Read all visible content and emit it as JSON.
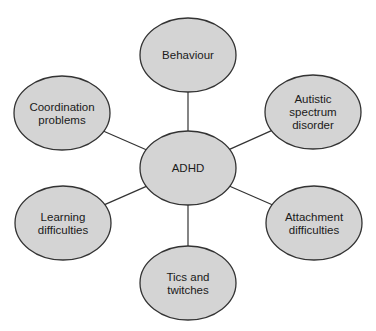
{
  "diagram": {
    "type": "mind-map",
    "center": {
      "id": "adhd",
      "label": [
        "ADHD"
      ],
      "cx": 188,
      "cy": 168
    },
    "nodes": [
      {
        "id": "behaviour",
        "label": [
          "Behaviour"
        ],
        "cx": 188,
        "cy": 55
      },
      {
        "id": "coordination",
        "label": [
          "Coordination",
          "problems"
        ],
        "cx": 62,
        "cy": 113
      },
      {
        "id": "autistic",
        "label": [
          "Autistic",
          "spectrum",
          "disorder"
        ],
        "cx": 313,
        "cy": 112
      },
      {
        "id": "learning",
        "label": [
          "Learning",
          "difficulties"
        ],
        "cx": 63,
        "cy": 223
      },
      {
        "id": "attachment",
        "label": [
          "Attachment",
          "difficulties"
        ],
        "cx": 314,
        "cy": 223
      },
      {
        "id": "tics",
        "label": [
          "Tics and",
          "twitches"
        ],
        "cx": 188,
        "cy": 283
      }
    ],
    "node_rx": 48,
    "node_ry": 37,
    "style": {
      "fill": "#d4d4d4",
      "stroke": "#333333",
      "line": "#333333"
    }
  }
}
